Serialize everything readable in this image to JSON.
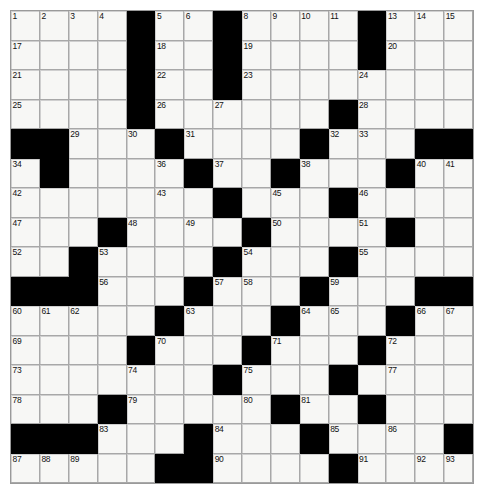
{
  "puzzle": {
    "title": "",
    "type": "crossword-grid",
    "rows": 16,
    "cols": 16,
    "cell_size_px": 29,
    "colors": {
      "block": "#000000",
      "cell": "#f7f7f5",
      "grid_line": "#8a8a8a",
      "number": "#111111",
      "page_background": "#ffffff"
    },
    "highest_clue_number": 107,
    "blocks": [
      [
        0,
        4
      ],
      [
        0,
        7
      ],
      [
        0,
        12
      ],
      [
        1,
        4
      ],
      [
        1,
        7
      ],
      [
        1,
        12
      ],
      [
        2,
        4
      ],
      [
        2,
        7
      ],
      [
        3,
        4
      ],
      [
        3,
        11
      ],
      [
        4,
        0
      ],
      [
        4,
        1
      ],
      [
        4,
        5
      ],
      [
        4,
        10
      ],
      [
        4,
        14
      ],
      [
        4,
        15
      ],
      [
        5,
        1
      ],
      [
        5,
        6
      ],
      [
        5,
        9
      ],
      [
        5,
        13
      ],
      [
        6,
        7
      ],
      [
        6,
        11
      ],
      [
        7,
        3
      ],
      [
        7,
        8
      ],
      [
        7,
        13
      ],
      [
        8,
        2
      ],
      [
        8,
        7
      ],
      [
        8,
        11
      ],
      [
        9,
        0
      ],
      [
        9,
        1
      ],
      [
        9,
        2
      ],
      [
        9,
        6
      ],
      [
        9,
        10
      ],
      [
        9,
        14
      ],
      [
        9,
        15
      ],
      [
        10,
        5
      ],
      [
        10,
        9
      ],
      [
        10,
        13
      ],
      [
        11,
        4
      ],
      [
        11,
        8
      ],
      [
        11,
        12
      ],
      [
        12,
        7
      ],
      [
        12,
        11
      ],
      [
        13,
        3
      ],
      [
        13,
        9
      ],
      [
        13,
        12
      ],
      [
        14,
        0
      ],
      [
        14,
        1
      ],
      [
        14,
        2
      ],
      [
        14,
        6
      ],
      [
        14,
        10
      ],
      [
        14,
        15
      ],
      [
        15,
        5
      ],
      [
        15,
        6
      ],
      [
        15,
        11
      ],
      [
        16,
        0
      ]
    ],
    "numbers": [
      {
        "r": 0,
        "c": 0,
        "n": 1
      },
      {
        "r": 0,
        "c": 1,
        "n": 2
      },
      {
        "r": 0,
        "c": 2,
        "n": 3
      },
      {
        "r": 0,
        "c": 3,
        "n": 4
      },
      {
        "r": 0,
        "c": 5,
        "n": 5
      },
      {
        "r": 0,
        "c": 6,
        "n": 6
      },
      {
        "r": 0,
        "c": 7,
        "n": 7
      },
      {
        "r": 0,
        "c": 8,
        "n": 8
      },
      {
        "r": 0,
        "c": 9,
        "n": 9
      },
      {
        "r": 0,
        "c": 10,
        "n": 10
      },
      {
        "r": 0,
        "c": 11,
        "n": 11
      },
      {
        "r": 0,
        "c": 12,
        "n": 12
      },
      {
        "r": 0,
        "c": 13,
        "n": 13
      },
      {
        "r": 0,
        "c": 14,
        "n": 14
      },
      {
        "r": 0,
        "c": 15,
        "n": 15
      },
      {
        "r": 0,
        "c": 16,
        "n": 16
      },
      {
        "r": 1,
        "c": 0,
        "n": 17
      },
      {
        "r": 1,
        "c": 5,
        "n": 18
      },
      {
        "r": 1,
        "c": 8,
        "n": 19
      },
      {
        "r": 1,
        "c": 13,
        "n": 20
      },
      {
        "r": 2,
        "c": 0,
        "n": 21
      },
      {
        "r": 2,
        "c": 5,
        "n": 22
      },
      {
        "r": 2,
        "c": 8,
        "n": 23
      },
      {
        "r": 2,
        "c": 12,
        "n": 24
      },
      {
        "r": 3,
        "c": 0,
        "n": 25
      },
      {
        "r": 3,
        "c": 5,
        "n": 26
      },
      {
        "r": 3,
        "c": 7,
        "n": 27
      },
      {
        "r": 3,
        "c": 12,
        "n": 28
      },
      {
        "r": 4,
        "c": 2,
        "n": 29
      },
      {
        "r": 4,
        "c": 4,
        "n": 30
      },
      {
        "r": 4,
        "c": 6,
        "n": 31
      },
      {
        "r": 4,
        "c": 11,
        "n": 32
      },
      {
        "r": 4,
        "c": 12,
        "n": 33
      },
      {
        "r": 5,
        "c": 0,
        "n": 34
      },
      {
        "r": 5,
        "c": 1,
        "n": 35
      },
      {
        "r": 5,
        "c": 5,
        "n": 36
      },
      {
        "r": 5,
        "c": 7,
        "n": 37
      },
      {
        "r": 5,
        "c": 10,
        "n": 38
      },
      {
        "r": 5,
        "c": 13,
        "n": 39
      },
      {
        "r": 5,
        "c": 14,
        "n": 40
      },
      {
        "r": 5,
        "c": 15,
        "n": 41
      },
      {
        "r": 6,
        "c": 0,
        "n": 42
      },
      {
        "r": 6,
        "c": 5,
        "n": 43
      },
      {
        "r": 6,
        "c": 7,
        "n": 44
      },
      {
        "r": 6,
        "c": 9,
        "n": 45
      },
      {
        "r": 6,
        "c": 12,
        "n": 46
      },
      {
        "r": 7,
        "c": 0,
        "n": 47
      },
      {
        "r": 7,
        "c": 4,
        "n": 48
      },
      {
        "r": 7,
        "c": 6,
        "n": 49
      },
      {
        "r": 7,
        "c": 9,
        "n": 50
      },
      {
        "r": 7,
        "c": 12,
        "n": 51
      },
      {
        "r": 8,
        "c": 0,
        "n": 52
      },
      {
        "r": 8,
        "c": 3,
        "n": 53
      },
      {
        "r": 8,
        "c": 8,
        "n": 54
      },
      {
        "r": 8,
        "c": 12,
        "n": 55
      },
      {
        "r": 9,
        "c": 3,
        "n": 56
      },
      {
        "r": 9,
        "c": 7,
        "n": 57
      },
      {
        "r": 9,
        "c": 8,
        "n": 58
      },
      {
        "r": 9,
        "c": 11,
        "n": 59
      },
      {
        "r": 10,
        "c": 0,
        "n": 60
      },
      {
        "r": 10,
        "c": 1,
        "n": 61
      },
      {
        "r": 10,
        "c": 2,
        "n": 62
      },
      {
        "r": 10,
        "c": 6,
        "n": 63
      },
      {
        "r": 10,
        "c": 10,
        "n": 64
      },
      {
        "r": 10,
        "c": 11,
        "n": 65
      },
      {
        "r": 10,
        "c": 14,
        "n": 66
      },
      {
        "r": 10,
        "c": 15,
        "n": 67
      },
      {
        "r": 10,
        "c": 16,
        "n": 68
      },
      {
        "r": 11,
        "c": 0,
        "n": 69
      },
      {
        "r": 11,
        "c": 5,
        "n": 70
      },
      {
        "r": 11,
        "c": 9,
        "n": 71
      },
      {
        "r": 11,
        "c": 13,
        "n": 72
      },
      {
        "r": 12,
        "c": 0,
        "n": 73
      },
      {
        "r": 12,
        "c": 4,
        "n": 74
      },
      {
        "r": 12,
        "c": 8,
        "n": 75
      },
      {
        "r": 12,
        "c": 11,
        "n": 76
      },
      {
        "r": 12,
        "c": 13,
        "n": 77
      },
      {
        "r": 13,
        "c": 0,
        "n": 78
      },
      {
        "r": 13,
        "c": 4,
        "n": 79
      },
      {
        "r": 13,
        "c": 8,
        "n": 80
      },
      {
        "r": 13,
        "c": 10,
        "n": 81
      },
      {
        "r": 13,
        "c": 12,
        "n": 82
      },
      {
        "r": 14,
        "c": 3,
        "n": 83
      },
      {
        "r": 14,
        "c": 7,
        "n": 84
      },
      {
        "r": 14,
        "c": 11,
        "n": 85
      },
      {
        "r": 14,
        "c": 13,
        "n": 86
      },
      {
        "r": 15,
        "c": 0,
        "n": 87
      },
      {
        "r": 15,
        "c": 1,
        "n": 88
      },
      {
        "r": 15,
        "c": 2,
        "n": 89
      },
      {
        "r": 15,
        "c": 7,
        "n": 90
      },
      {
        "r": 15,
        "c": 12,
        "n": 91
      },
      {
        "r": 15,
        "c": 14,
        "n": 92
      },
      {
        "r": 15,
        "c": 15,
        "n": 93
      },
      {
        "r": 15,
        "c": 16,
        "n": 94
      },
      {
        "r": 16,
        "c": 0,
        "n": 95
      },
      {
        "r": 16,
        "c": 5,
        "n": 96
      },
      {
        "r": 16,
        "c": 6,
        "n": 97
      },
      {
        "r": 16,
        "c": 11,
        "n": 98
      },
      {
        "r": 16,
        "c": 14,
        "n": 99
      },
      {
        "r": 17,
        "c": 0,
        "n": 100
      },
      {
        "r": 17,
        "c": 5,
        "n": 101
      },
      {
        "r": 17,
        "c": 11,
        "n": 102
      },
      {
        "r": 17,
        "c": 14,
        "n": 103
      },
      {
        "r": 18,
        "c": 0,
        "n": 104
      },
      {
        "r": 18,
        "c": 5,
        "n": 105
      },
      {
        "r": 18,
        "c": 11,
        "n": 106
      },
      {
        "r": 18,
        "c": 14,
        "n": 107
      }
    ],
    "grid": [
      [
        {
          "n": 1
        },
        {
          "n": 2
        },
        {
          "n": 3
        },
        {
          "n": 4
        },
        {
          "b": 1
        },
        {
          "n": 5
        },
        {
          "n": 6
        },
        {
          "n": 7
        },
        {
          "b": 1
        },
        {
          "n": 8
        },
        {
          "n": 9
        },
        {
          "n": 10
        },
        {
          "n": 11
        },
        {
          "n": 12
        },
        {
          "b": 1
        },
        {
          "n": 13
        }
      ],
      [
        {
          "n": 17
        },
        {},
        {},
        {},
        {
          "b": 1
        },
        {
          "n": 18
        },
        {},
        {},
        {
          "b": 1
        },
        {
          "n": 19
        },
        {},
        {},
        {},
        {},
        {
          "b": 1
        },
        {
          "n": 20
        }
      ],
      [
        {
          "n": 21
        },
        {},
        {},
        {},
        {
          "b": 1
        },
        {
          "n": 22
        },
        {},
        {},
        {
          "b": 1
        },
        {
          "n": 23
        },
        {},
        {},
        {},
        {},
        {
          "n": 24
        },
        {}
      ],
      [
        {
          "n": 25
        },
        {},
        {},
        {},
        {
          "b": 1
        },
        {
          "n": 26
        },
        {},
        {},
        {
          "n": 27
        },
        {},
        {},
        {},
        {
          "b": 1
        },
        {
          "b": 1
        },
        {
          "n": 28
        },
        {}
      ],
      [
        {
          "b": 1
        },
        {
          "b": 1
        },
        {
          "n": 29
        },
        {},
        {
          "n": 30
        },
        {
          "b": 1
        },
        {
          "n": 31
        },
        {},
        {},
        {},
        {},
        {
          "b": 1
        },
        {
          "n": 32
        },
        {
          "n": 33
        },
        {},
        {}
      ],
      [
        {
          "n": 34
        },
        {
          "n": 35
        },
        {},
        {},
        {},
        {
          "n": 36
        },
        {
          "b": 1
        },
        {
          "n": 37
        },
        {},
        {},
        {
          "b": 1
        },
        {
          "n": 38
        },
        {},
        {},
        {},
        {
          "b": 1
        }
      ],
      [
        {
          "n": 42
        },
        {},
        {},
        {},
        {},
        {
          "n": 43
        },
        {
          "b": 1
        },
        {
          "n": 44
        },
        {},
        {
          "n": 45
        },
        {},
        {},
        {},
        {
          "n": 46
        },
        {},
        {}
      ],
      [
        {
          "n": 47
        },
        {},
        {},
        {},
        {
          "b": 1
        },
        {
          "n": 48
        },
        {},
        {
          "n": 49
        },
        {},
        {
          "b": 1
        },
        {
          "n": 50
        },
        {},
        {},
        {
          "b": 1
        },
        {
          "n": 51
        },
        {}
      ],
      [
        {
          "n": 52
        },
        {},
        {},
        {
          "b": 1
        },
        {
          "n": 53
        },
        {},
        {},
        {},
        {
          "b": 1
        },
        {
          "n": 54
        },
        {},
        {},
        {},
        {
          "b": 1
        },
        {
          "n": 55
        },
        {}
      ],
      [
        {
          "b": 1
        },
        {
          "b": 1
        },
        {
          "b": 1
        },
        {
          "n": 56
        },
        {},
        {},
        {
          "b": 1
        },
        {
          "n": 57
        },
        {
          "n": 58
        },
        {},
        {},
        {},
        {
          "b": 1
        },
        {
          "n": 59
        },
        {},
        {}
      ],
      [
        {
          "n": 60
        },
        {
          "n": 61
        },
        {
          "n": 62
        },
        {},
        {},
        {
          "b": 1
        },
        {
          "n": 63
        },
        {},
        {},
        {},
        {
          "b": 1
        },
        {
          "n": 64
        },
        {
          "n": 65
        },
        {},
        {},
        {
          "b": 1
        }
      ],
      [
        {
          "n": 69
        },
        {},
        {},
        {},
        {},
        {
          "b": 1
        },
        {
          "n": 70
        },
        {},
        {},
        {},
        {
          "b": 1
        },
        {
          "n": 71
        },
        {},
        {},
        {},
        {
          "b": 1
        }
      ],
      [
        {
          "n": 73
        },
        {},
        {},
        {},
        {
          "n": 74
        },
        {},
        {},
        {},
        {
          "n": 75
        },
        {},
        {
          "b": 1
        },
        {
          "n": 76
        },
        {},
        {
          "n": 77
        },
        {},
        {}
      ],
      [
        {
          "n": 78
        },
        {},
        {},
        {
          "b": 1
        },
        {
          "n": 79
        },
        {},
        {},
        {},
        {
          "n": 80
        },
        {},
        {
          "n": 81
        },
        {
          "b": 1
        },
        {
          "n": 82
        },
        {},
        {},
        {}
      ],
      [
        {
          "b": 1
        },
        {
          "b": 1
        },
        {
          "b": 1
        },
        {
          "n": 83
        },
        {},
        {},
        {},
        {
          "n": 84
        },
        {},
        {},
        {},
        {
          "n": 85
        },
        {
          "b": 1
        },
        {
          "n": 86
        },
        {},
        {}
      ],
      [
        {
          "n": 87
        },
        {
          "n": 88
        },
        {
          "n": 89
        },
        {},
        {},
        {
          "b": 1
        },
        {
          "b": 1
        },
        {
          "n": 90
        },
        {},
        {},
        {},
        {},
        {
          "n": 91
        },
        {
          "b": 1
        },
        {
          "n": 92
        },
        {}
      ]
    ],
    "layout": {
      "origin_x_px": 10,
      "origin_y_px": 10,
      "grid_width_px": 462,
      "grid_height_px": 473
    }
  }
}
